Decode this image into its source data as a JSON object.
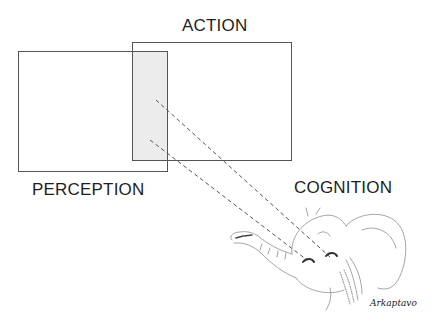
{
  "diagram": {
    "labels": {
      "action": "ACTION",
      "perception": "PERCEPTION",
      "cognition": "COGNITION"
    },
    "signature": "Arkaptavo",
    "boxes": {
      "perception": {
        "x": 18,
        "y": 51,
        "w": 150,
        "h": 121
      },
      "action": {
        "x": 132,
        "y": 42,
        "w": 160,
        "h": 119
      },
      "overlap": {
        "x": 132,
        "y": 51,
        "w": 36,
        "h": 110,
        "fill": "#ececec"
      }
    },
    "connectors": [
      {
        "from": [
          156,
          100
        ],
        "to": [
          330,
          257
        ],
        "style": "dashed"
      },
      {
        "from": [
          150,
          140
        ],
        "to": [
          307,
          260
        ],
        "style": "dashed"
      }
    ],
    "colors": {
      "box_border": "#555555",
      "overlap_fill": "#ececec",
      "sketch": "#9a9a9a"
    },
    "illustration": "elephant-head-sketch"
  }
}
